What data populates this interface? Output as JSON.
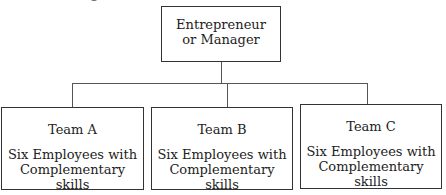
{
  "diagram": {
    "type": "org-chart",
    "root": {
      "line1": "Entrepreneur",
      "line2": "or Manager"
    },
    "teams": [
      {
        "name": "Team A",
        "desc_line1": "Six Employees with",
        "desc_line2": "Complementary skills"
      },
      {
        "name": "Team B",
        "desc_line1": "Six Employees with",
        "desc_line2": "Complementary skills"
      },
      {
        "name": "Team C",
        "desc_line1": "Six Employees with",
        "desc_line2": "Complementary skills"
      }
    ],
    "edges": [
      [
        "Entrepreneur or Manager",
        "Team A"
      ],
      [
        "Entrepreneur or Manager",
        "Team B"
      ],
      [
        "Entrepreneur or Manager",
        "Team C"
      ]
    ],
    "colors": {
      "stroke": "#333333",
      "text": "#222222",
      "background": "#ffffff"
    }
  }
}
